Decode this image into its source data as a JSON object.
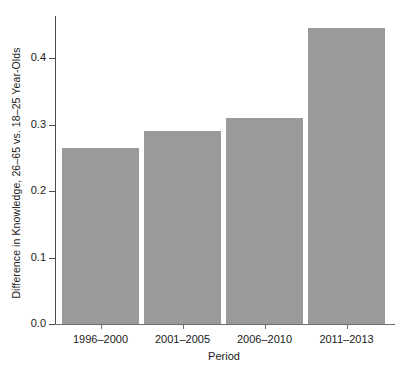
{
  "chart_data": {
    "type": "bar",
    "title": "",
    "subtitle": "",
    "xlabel": "Period",
    "ylabel": "Difference in Knowledge, 26–65 vs. 18–25 Year-Olds",
    "categories": [
      "1996–2000",
      "2001–2005",
      "2006–2010",
      "2011–2013"
    ],
    "values": [
      0.265,
      0.29,
      0.31,
      0.445
    ],
    "ylim": [
      0.0,
      0.47
    ],
    "yticks": [
      0.0,
      0.1,
      0.2,
      0.3,
      0.4
    ],
    "ytick_labels": [
      "0.0",
      "0.1",
      "0.2",
      "0.3",
      "0.4"
    ],
    "grid": false,
    "legend": null,
    "bar_color": "#9a9a9a",
    "axis_color": "#4d4d4d",
    "background": "#ffffff"
  }
}
